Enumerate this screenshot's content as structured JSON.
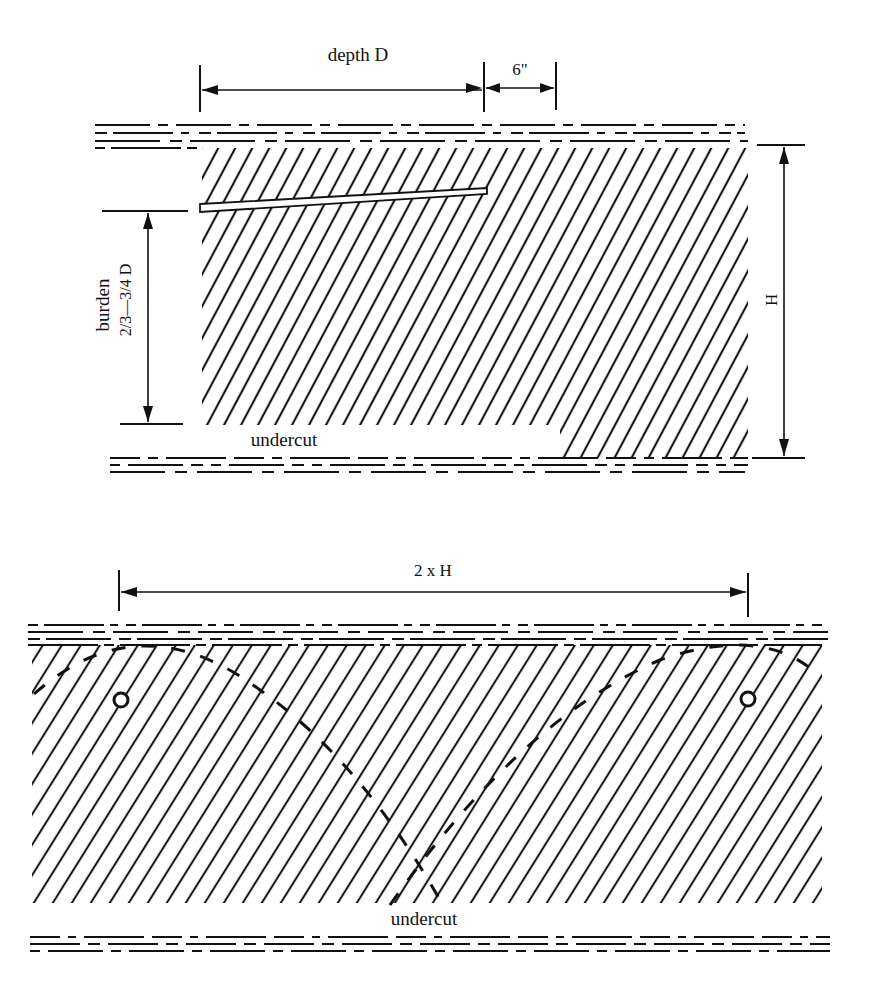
{
  "figure": {
    "top_panel": {
      "depth_label": "depth D",
      "clearance_label": "6\"",
      "burden_label": "burden",
      "burden_ratio_label": "2/3—3/4 D",
      "height_label": "H",
      "undercut_label": "undercut"
    },
    "bottom_panel": {
      "spacing_label": "2 x H",
      "undercut_label": "undercut",
      "shotholes": 2
    }
  },
  "colors": {
    "ink": "#111111",
    "paper": "#ffffff"
  }
}
